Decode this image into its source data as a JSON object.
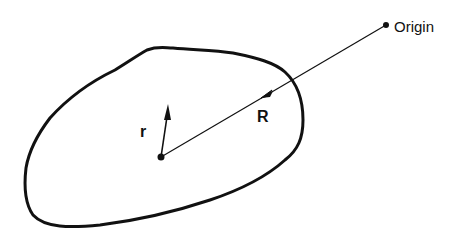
{
  "diagram": {
    "labels": {
      "origin": "Origin",
      "R": "R",
      "r": "r"
    },
    "colors": {
      "stroke": "#111111",
      "background": "#ffffff"
    },
    "points": {
      "origin": [
        386,
        25
      ],
      "body_center": [
        161,
        157
      ],
      "r_tip": [
        168,
        105
      ]
    }
  }
}
